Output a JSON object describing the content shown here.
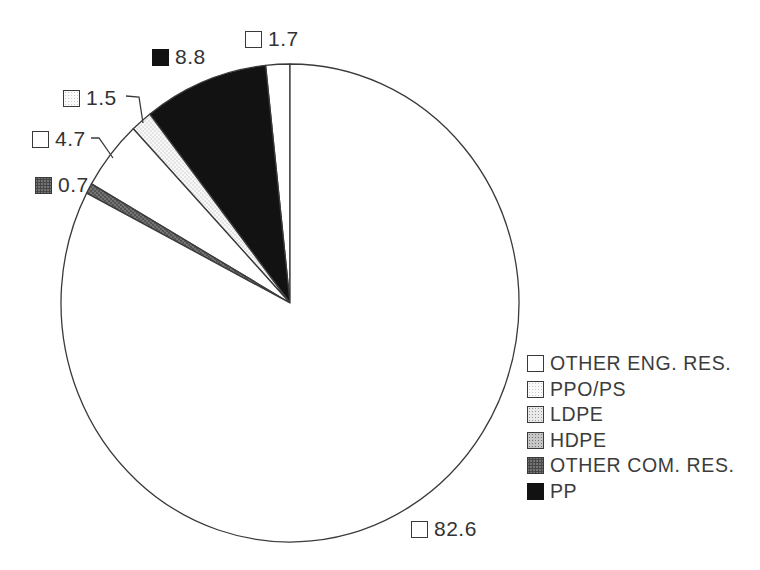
{
  "chart_data": {
    "type": "pie",
    "unit": "percent",
    "total": 100,
    "direction": "counterclockwise",
    "start_angle_deg": 0,
    "legend_position": "right",
    "slices_ccw_from_top": [
      {
        "label": "OTHER ENG. RES.",
        "value": 1.7,
        "fill": "white"
      },
      {
        "label": "PP",
        "value": 8.8,
        "fill": "black"
      },
      {
        "label": "PPO/PS",
        "value": 1.5,
        "fill": "stipple-xlight"
      },
      {
        "label": "LDPE",
        "value": 4.7,
        "fill": "white"
      },
      {
        "label": "OTHER COM. RES.",
        "value": 0.7,
        "fill": "stipple-dark"
      },
      {
        "label": "HDPE",
        "value": 82.6,
        "fill": "white"
      }
    ],
    "legend": [
      {
        "label": "OTHER ENG. RES.",
        "swatch": "white"
      },
      {
        "label": "PPO/PS",
        "swatch": "stipple-xlight"
      },
      {
        "label": "LDPE",
        "swatch": "stipple-light"
      },
      {
        "label": "HDPE",
        "swatch": "stipple-medium"
      },
      {
        "label": "OTHER COM. RES.",
        "swatch": "stipple-dark"
      },
      {
        "label": "PP",
        "swatch": "black"
      }
    ]
  },
  "colors": {
    "ink": "#3a3a3a",
    "slice_black": "#121212",
    "white": "#ffffff"
  }
}
